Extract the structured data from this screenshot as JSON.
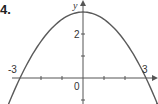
{
  "problem_number": "4.",
  "chart_data": {
    "type": "line",
    "title": "",
    "xlabel": "",
    "ylabel": "y",
    "function": "y = 3 - x^2/3",
    "x": [
      -3.6,
      -3,
      -2,
      -1,
      0,
      1,
      2,
      3,
      3.6
    ],
    "values": [
      -1.32,
      0,
      1.67,
      2.67,
      3,
      2.67,
      1.67,
      0,
      -1.32
    ],
    "x_tick_labels": [
      "-3",
      "3"
    ],
    "y_tick_labels": [
      "2"
    ],
    "origin_label": "0",
    "xlim": [
      -3.4,
      3.5
    ],
    "ylim": [
      -1.2,
      3.5
    ],
    "grid": false,
    "legend": null,
    "curve_color": "#5a5a5a",
    "axis_color": "#555555"
  }
}
